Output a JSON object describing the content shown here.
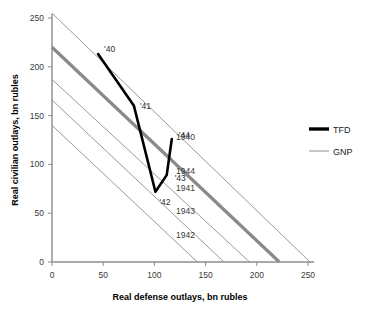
{
  "chart_data": {
    "type": "line",
    "title": "",
    "xlabel": "Real defense outlays, bn rubles",
    "ylabel": "Real civilian outlays, bn rubles",
    "xlim": [
      0,
      250
    ],
    "ylim": [
      0,
      250
    ],
    "xticks": [
      0,
      50,
      100,
      150,
      200,
      250
    ],
    "yticks": [
      0,
      50,
      100,
      150,
      200,
      250
    ],
    "xtick_labels": [
      "0",
      "50",
      "100",
      "150",
      "200",
      "250"
    ],
    "ytick_labels": [
      "0",
      "50",
      "100",
      "150",
      "200",
      "250"
    ],
    "grid": false,
    "legend_position": "right",
    "legend": [
      {
        "name": "TFD",
        "style": "thick-black"
      },
      {
        "name": "GNP",
        "style": "thin-gray"
      }
    ],
    "series": [
      {
        "name": "TFD",
        "style": "thick-black",
        "points": [
          {
            "label": "'40",
            "x": 45,
            "y": 213
          },
          {
            "label": "'41",
            "x": 80,
            "y": 160
          },
          {
            "label": "'42",
            "x": 101,
            "y": 72
          },
          {
            "label": "'43",
            "x": 112,
            "y": 89
          },
          {
            "label": "'44",
            "x": 117,
            "y": 126
          }
        ]
      }
    ],
    "gnp_lines": [
      {
        "label": "1940",
        "y_intercept": 255,
        "x_intercept": 252,
        "weight": "thin",
        "label_x": 176,
        "label_y": 140
      },
      {
        "label": "1944",
        "y_intercept": 220,
        "x_intercept": 222,
        "weight": "thick",
        "label_x": 176,
        "label_y": 174
      },
      {
        "label": "1941",
        "y_intercept": 187,
        "x_intercept": 193,
        "weight": "thin",
        "label_x": 176,
        "label_y": 191
      },
      {
        "label": "1943",
        "y_intercept": 166,
        "x_intercept": 168,
        "weight": "thin",
        "label_x": 176,
        "label_y": 214
      },
      {
        "label": "1942",
        "y_intercept": 140,
        "x_intercept": 142,
        "weight": "thin",
        "label_x": 176,
        "label_y": 238
      }
    ],
    "colors": {
      "tfd": "#000000",
      "gnp": "#9a9a9a",
      "gnp_thick": "#8a8a8a",
      "axis": "#8c8c8c",
      "text": "#1a1a1a"
    }
  }
}
